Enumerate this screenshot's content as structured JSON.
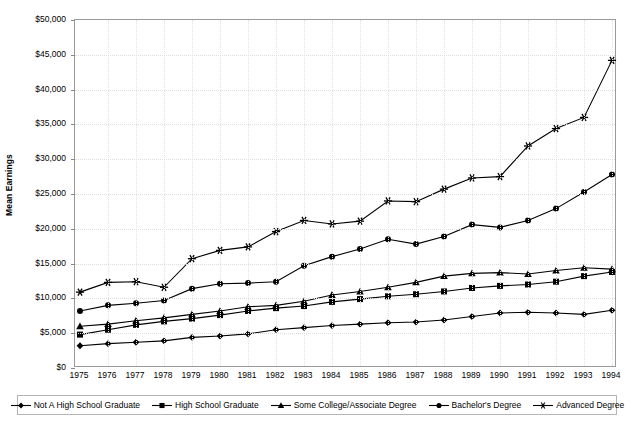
{
  "chart_data": {
    "type": "line",
    "title": "",
    "xlabel": "",
    "ylabel": "Mean Earnings",
    "ylim": [
      0,
      50000
    ],
    "ytick_labels": [
      "$50,000",
      "$45,000",
      "$40,000",
      "$35,000",
      "$30,000",
      "$25,000",
      "$20,000",
      "$15,000",
      "$10,000",
      "$5,000",
      "$0"
    ],
    "ytick_values": [
      50000,
      45000,
      40000,
      35000,
      30000,
      25000,
      20000,
      15000,
      10000,
      5000,
      0
    ],
    "grid": true,
    "legend_position": "bottom",
    "categories": [
      "1975",
      "1976",
      "1977",
      "1978",
      "1979",
      "1980",
      "1981",
      "1982",
      "1983",
      "1984",
      "1985",
      "1986",
      "1987",
      "1988",
      "1989",
      "1990",
      "1991",
      "1992",
      "1993",
      "1994"
    ],
    "series": [
      {
        "name": "Not A High School Graduate",
        "marker": "diamond",
        "values": [
          3200,
          3500,
          3700,
          3900,
          4400,
          4600,
          4900,
          5500,
          5800,
          6100,
          6300,
          6500,
          6600,
          6900,
          7400,
          7900,
          8000,
          7900,
          7700,
          8300
        ]
      },
      {
        "name": "High School Graduate",
        "marker": "square",
        "values": [
          4800,
          5500,
          6200,
          6700,
          7100,
          7600,
          8200,
          8600,
          8900,
          9500,
          9900,
          10300,
          10600,
          11000,
          11500,
          11800,
          12000,
          12400,
          13200,
          13800
        ]
      },
      {
        "name": "Some College/Associate Degree",
        "marker": "triangle",
        "values": [
          6000,
          6300,
          6800,
          7200,
          7700,
          8200,
          8800,
          9000,
          9600,
          10500,
          11000,
          11600,
          12300,
          13200,
          13600,
          13700,
          13500,
          14000,
          14400,
          14200
        ]
      },
      {
        "name": "Bachelor's Degree",
        "marker": "circle",
        "values": [
          8200,
          9000,
          9300,
          9700,
          11400,
          12100,
          12200,
          12400,
          14700,
          16000,
          17100,
          18500,
          17800,
          18900,
          20600,
          20200,
          21200,
          22900,
          25300,
          27800
        ]
      },
      {
        "name": "Advanced Degree",
        "marker": "asterisk",
        "values": [
          10900,
          12300,
          12400,
          11600,
          15700,
          16900,
          17400,
          19600,
          21200,
          20700,
          21100,
          24000,
          23900,
          25700,
          27300,
          27500,
          31900,
          34400,
          36000,
          44200
        ]
      }
    ]
  },
  "legend": {
    "entries": [
      {
        "label": "Not A High School Graduate",
        "marker": "diamond"
      },
      {
        "label": "High School Graduate",
        "marker": "square"
      },
      {
        "label": "Some College/Associate Degree",
        "marker": "triangle"
      },
      {
        "label": "Bachelor's Degree",
        "marker": "circle"
      },
      {
        "label": "Advanced Degree",
        "marker": "asterisk"
      }
    ]
  },
  "colors": {
    "series_line": "#000000",
    "grid": "#dddddd",
    "frame": "#9a9a9a",
    "text": "#000000"
  }
}
